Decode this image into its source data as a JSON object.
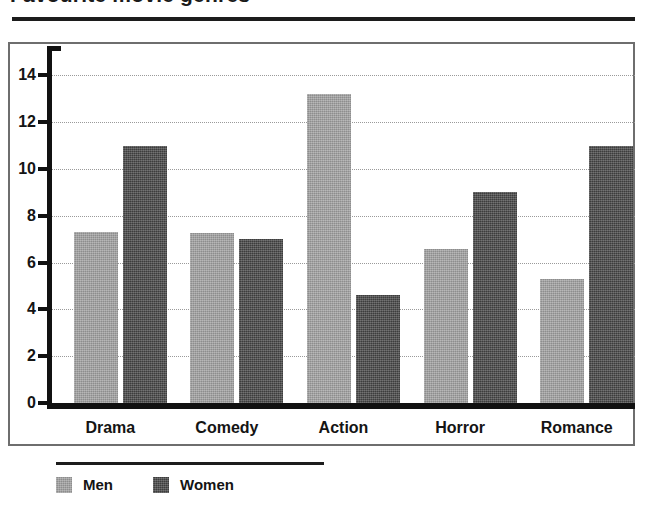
{
  "title": "Favourite movie genres",
  "chart_data": {
    "type": "bar",
    "title": "Favourite movie genres",
    "xlabel": "",
    "ylabel": "",
    "categories": [
      "Drama",
      "Comedy",
      "Action",
      "Horror",
      "Romance"
    ],
    "series": [
      {
        "name": "Men",
        "color": "#9d9d9d",
        "values": [
          7.3,
          7.25,
          13.2,
          6.6,
          5.3
        ]
      },
      {
        "name": "Women",
        "color": "#4c4c4c",
        "values": [
          11.0,
          7.0,
          4.6,
          9.0,
          11.0
        ]
      }
    ],
    "ylim": [
      0,
      15
    ],
    "yticks": [
      0,
      2,
      4,
      6,
      8,
      10,
      12,
      14
    ],
    "ytick_labels": [
      "0",
      "2",
      "4",
      "6",
      "8",
      "10",
      "12",
      "14"
    ],
    "grid": true,
    "grid_style": "dotted-horizontal",
    "legend": {
      "position": "bottom-left",
      "entries": [
        "Men",
        "Women"
      ]
    }
  },
  "axis": {
    "y_labels": [
      "14",
      "12",
      "10",
      "8",
      "6",
      "4",
      "2",
      "0"
    ]
  },
  "legend": {
    "men_label": "Men",
    "women_label": "Women"
  }
}
